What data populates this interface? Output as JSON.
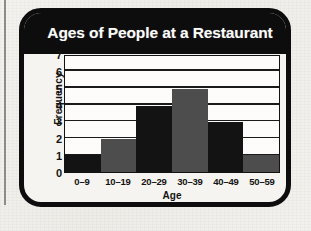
{
  "chart_data": {
    "type": "bar",
    "title": "Ages of People at a Restaurant",
    "xlabel": "Age",
    "ylabel": "Frequency",
    "categories": [
      "0–9",
      "10–19",
      "20–29",
      "30–39",
      "40–49",
      "50–59"
    ],
    "values": [
      1,
      2,
      4,
      5,
      3,
      1
    ],
    "bar_colors": [
      "#131313",
      "#4d4d4d",
      "#131313",
      "#4d4d4d",
      "#131313",
      "#4d4d4d"
    ],
    "ylim": [
      0,
      7
    ],
    "yticks": [
      0,
      1,
      2,
      3,
      4,
      5,
      6,
      7
    ],
    "ytick_labels": [
      "0",
      "1",
      "2",
      "3",
      "4",
      "5",
      "6",
      "7"
    ],
    "grid": true,
    "legend": "none",
    "colors": {
      "frame": "#0d0d0d",
      "title_band": "#0d0d0d",
      "title_text": "#fbfbfa",
      "plot_background": "#fdfcfa",
      "paper": "#f2f0ec",
      "axis": "#131313"
    }
  }
}
